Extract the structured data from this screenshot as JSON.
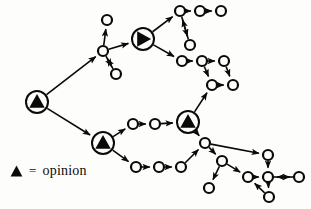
{
  "figure": {
    "kind": "directed-graph-diagram",
    "background_color": "#fdfdfb",
    "ink_color": "#0a0a0a"
  },
  "legend": {
    "marker_name": "triangle-marker",
    "equals_symbol": "=",
    "label": "opinion"
  },
  "graph": {
    "node_styles": {
      "opinion": {
        "radius": 11,
        "fill": "#fdfdfb",
        "stroke": "#0a0a0a",
        "stroke_width": 2,
        "glyph": "triangle"
      },
      "plain": {
        "radius": 5,
        "fill": "#fdfdfb",
        "stroke": "#0a0a0a",
        "stroke_width": 2.2,
        "glyph": "none"
      }
    },
    "nodes": [
      {
        "id": "op1",
        "type": "opinion",
        "x": 37,
        "y": 102,
        "rotation": 0,
        "label": "opinion-node-root"
      },
      {
        "id": "op2",
        "type": "opinion",
        "x": 143,
        "y": 39,
        "rotation": 90,
        "label": "opinion-node-upper"
      },
      {
        "id": "op3",
        "type": "opinion",
        "x": 103,
        "y": 143,
        "rotation": 0,
        "label": "opinion-node-lower-left"
      },
      {
        "id": "op4",
        "type": "opinion",
        "x": 188,
        "y": 122,
        "rotation": 0,
        "label": "opinion-node-center-right"
      },
      {
        "id": "n1",
        "type": "plain",
        "x": 103,
        "y": 51,
        "label": "node-hub-upper-left"
      },
      {
        "id": "n2",
        "type": "plain",
        "x": 107,
        "y": 20,
        "label": "node-upper-left-top"
      },
      {
        "id": "n3",
        "type": "plain",
        "x": 116,
        "y": 74,
        "label": "node-upper-left-bottom"
      },
      {
        "id": "n4",
        "type": "plain",
        "x": 180,
        "y": 11,
        "label": "node-top-1"
      },
      {
        "id": "n5",
        "type": "plain",
        "x": 200,
        "y": 11,
        "label": "node-top-2"
      },
      {
        "id": "n6",
        "type": "plain",
        "x": 221,
        "y": 11,
        "label": "node-top-3"
      },
      {
        "id": "n7",
        "type": "plain",
        "x": 190,
        "y": 45,
        "label": "node-top-pendant"
      },
      {
        "id": "n8",
        "type": "plain",
        "x": 182,
        "y": 61,
        "label": "node-mid-right-1"
      },
      {
        "id": "n9",
        "type": "plain",
        "x": 202,
        "y": 61,
        "label": "node-mid-right-2"
      },
      {
        "id": "n10",
        "type": "plain",
        "x": 224,
        "y": 61,
        "label": "node-mid-right-3"
      },
      {
        "id": "n11",
        "type": "plain",
        "x": 212,
        "y": 85,
        "label": "node-mid-right-4"
      },
      {
        "id": "n12",
        "type": "plain",
        "x": 233,
        "y": 85,
        "label": "node-mid-right-5"
      },
      {
        "id": "n13",
        "type": "plain",
        "x": 133,
        "y": 124,
        "label": "node-center-chain-1"
      },
      {
        "id": "n14",
        "type": "plain",
        "x": 155,
        "y": 124,
        "label": "node-center-chain-2"
      },
      {
        "id": "n15",
        "type": "plain",
        "x": 136,
        "y": 167,
        "label": "node-lower-chain-1"
      },
      {
        "id": "n16",
        "type": "plain",
        "x": 159,
        "y": 167,
        "label": "node-lower-chain-2"
      },
      {
        "id": "n17",
        "type": "plain",
        "x": 181,
        "y": 167,
        "label": "node-lower-chain-3"
      },
      {
        "id": "n18",
        "type": "plain",
        "x": 205,
        "y": 143,
        "label": "node-lower-hub"
      },
      {
        "id": "n19",
        "type": "plain",
        "x": 222,
        "y": 161,
        "label": "node-lower-branch"
      },
      {
        "id": "n20",
        "type": "plain",
        "x": 209,
        "y": 188,
        "label": "node-lower-pendant-left"
      },
      {
        "id": "n21",
        "type": "plain",
        "x": 248,
        "y": 177,
        "label": "node-lower-mid"
      },
      {
        "id": "n22",
        "type": "plain",
        "x": 268,
        "y": 155,
        "label": "node-lower-right-upper"
      },
      {
        "id": "n23",
        "type": "plain",
        "x": 268,
        "y": 177,
        "label": "node-lower-right-center"
      },
      {
        "id": "n24",
        "type": "plain",
        "x": 299,
        "y": 177,
        "label": "node-lower-right-end"
      },
      {
        "id": "n25",
        "type": "plain",
        "x": 269,
        "y": 197,
        "label": "node-lower-right-pendant"
      }
    ],
    "edges": [
      {
        "from": "op1",
        "to": "n1",
        "arrow": "end"
      },
      {
        "from": "op1",
        "to": "op3",
        "arrow": "end"
      },
      {
        "from": "n1",
        "to": "n2",
        "arrow": "end"
      },
      {
        "from": "n1",
        "to": "n3",
        "arrow": "end"
      },
      {
        "from": "n1",
        "to": "op2",
        "arrow": "end"
      },
      {
        "from": "n3",
        "to": "n1",
        "arrow": "end"
      },
      {
        "from": "op2",
        "to": "n4",
        "arrow": "end"
      },
      {
        "from": "op2",
        "to": "n8",
        "arrow": "end"
      },
      {
        "from": "n4",
        "to": "n5",
        "arrow": "end"
      },
      {
        "from": "n5",
        "to": "n6",
        "arrow": "end"
      },
      {
        "from": "n4",
        "to": "n7",
        "arrow": "end"
      },
      {
        "from": "n7",
        "to": "n4",
        "arrow": "end"
      },
      {
        "from": "n8",
        "to": "n9",
        "arrow": "end"
      },
      {
        "from": "n9",
        "to": "n10",
        "arrow": "end"
      },
      {
        "from": "n9",
        "to": "n11",
        "arrow": "end"
      },
      {
        "from": "n10",
        "to": "n12",
        "arrow": "end"
      },
      {
        "from": "n11",
        "to": "n12",
        "arrow": "end"
      },
      {
        "from": "op3",
        "to": "n13",
        "arrow": "end"
      },
      {
        "from": "n13",
        "to": "n14",
        "arrow": "end"
      },
      {
        "from": "n14",
        "to": "op4",
        "arrow": "end"
      },
      {
        "from": "op3",
        "to": "n15",
        "arrow": "end"
      },
      {
        "from": "n15",
        "to": "n16",
        "arrow": "end"
      },
      {
        "from": "n16",
        "to": "n17",
        "arrow": "end"
      },
      {
        "from": "n17",
        "to": "n18",
        "arrow": "end"
      },
      {
        "from": "op4",
        "to": "n11",
        "arrow": "end"
      },
      {
        "from": "op4",
        "to": "n18",
        "arrow": "end"
      },
      {
        "from": "n18",
        "to": "n19",
        "arrow": "end"
      },
      {
        "from": "n18",
        "to": "n22",
        "arrow": "end"
      },
      {
        "from": "n19",
        "to": "n20",
        "arrow": "end"
      },
      {
        "from": "n19",
        "to": "n21",
        "arrow": "end"
      },
      {
        "from": "n21",
        "to": "n23",
        "arrow": "end"
      },
      {
        "from": "n22",
        "to": "n23",
        "arrow": "end"
      },
      {
        "from": "n23",
        "to": "n24",
        "arrow": "end"
      },
      {
        "from": "n24",
        "to": "n23",
        "arrow": "end"
      },
      {
        "from": "n23",
        "to": "n25",
        "arrow": "end"
      },
      {
        "from": "n25",
        "to": "n21",
        "arrow": "end"
      }
    ]
  }
}
